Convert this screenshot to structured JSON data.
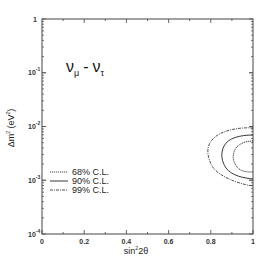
{
  "chart_data": {
    "type": "contour",
    "title_parts": {
      "nu1": "ν",
      "sub1": "μ",
      "dash": "-",
      "nu2": "ν",
      "sub2": "τ"
    },
    "xlabel": "sin²2θ",
    "xlabel_parts": {
      "base": "sin",
      "sup": "2",
      "rest": "2θ"
    },
    "ylabel": "Δm² (eV²)",
    "ylabel_parts": {
      "pre": "Δm",
      "sup": "2",
      "mid": " (eV",
      "sup2": "2",
      "post": ")"
    },
    "xlim": [
      0,
      1
    ],
    "ylim": [
      0.0001,
      1
    ],
    "yscale": "log",
    "x_ticks": [
      "0",
      "0.2",
      "0.4",
      "0.6",
      "0.8",
      "1"
    ],
    "y_ticks": [
      {
        "base": "10",
        "exp": "-4"
      },
      {
        "base": "10",
        "exp": "-3"
      },
      {
        "base": "10",
        "exp": "-2"
      },
      {
        "base": "10",
        "exp": "-1"
      },
      {
        "base": "1",
        "exp": ""
      }
    ],
    "grid": false,
    "legend_position": "left-middle",
    "series": [
      {
        "name": "68% C.L.",
        "style": "dotted",
        "x": [
          1.0,
          0.92,
          0.89,
          0.88,
          0.9,
          0.94,
          1.0
        ],
        "y": [
          0.0022,
          0.0024,
          0.003,
          0.0036,
          0.0045,
          0.0052,
          0.0055
        ]
      },
      {
        "name": "90% C.L.",
        "style": "solid",
        "x": [
          1.0,
          0.88,
          0.83,
          0.82,
          0.84,
          0.9,
          1.0
        ],
        "y": [
          0.0016,
          0.0019,
          0.0026,
          0.0035,
          0.005,
          0.0062,
          0.0068
        ]
      },
      {
        "name": "99% C.L.",
        "style": "dash-dot",
        "x": [
          1.0,
          0.8,
          0.75,
          0.73,
          0.75,
          0.85,
          1.0
        ],
        "y": [
          0.0012,
          0.0015,
          0.0022,
          0.0035,
          0.0055,
          0.0075,
          0.0085
        ]
      }
    ]
  },
  "legend": [
    {
      "label": "68% C.L.",
      "style": "dotted"
    },
    {
      "label": "90% C.L.",
      "style": "solid"
    },
    {
      "label": "99% C.L.",
      "style": "dash-dot"
    }
  ],
  "colors": {
    "axis": "#333333",
    "contour": "#222222",
    "background": "#ffffff"
  }
}
